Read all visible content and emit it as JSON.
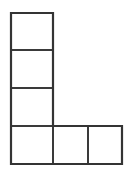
{
  "figure": {
    "name": "l-shape-polyomino",
    "title": "L-shaped grid of squares",
    "background_color": "#ffffff",
    "line_color": "#3a3a3a",
    "outline_color": "#343434",
    "cell_fill_color": "#ffffff",
    "line_width_px": 2,
    "canvas": {
      "width_px": 130,
      "height_px": 175
    },
    "grid": {
      "cell_width_px": 42,
      "cell_height_px": 38,
      "origin_x_px": 11,
      "origin_y_px": 13,
      "columns": 3,
      "rows": 4,
      "x_edges_px": [
        11,
        53,
        88,
        122
      ],
      "y_edges_px": [
        13,
        50,
        88,
        126,
        164
      ]
    },
    "cell_count": 6,
    "cells": [
      {
        "id": "cell-r0-c0",
        "row": 0,
        "col": 0,
        "x": 11,
        "y": 13,
        "width": 42,
        "height": 37,
        "label": ""
      },
      {
        "id": "cell-r1-c0",
        "row": 1,
        "col": 0,
        "x": 11,
        "y": 50,
        "width": 42,
        "height": 38,
        "label": ""
      },
      {
        "id": "cell-r2-c0",
        "row": 2,
        "col": 0,
        "x": 11,
        "y": 88,
        "width": 42,
        "height": 38,
        "label": ""
      },
      {
        "id": "cell-r3-c0",
        "row": 3,
        "col": 0,
        "x": 11,
        "y": 126,
        "width": 42,
        "height": 38,
        "label": ""
      },
      {
        "id": "cell-r3-c1",
        "row": 3,
        "col": 1,
        "x": 53,
        "y": 126,
        "width": 35,
        "height": 38,
        "label": ""
      },
      {
        "id": "cell-r3-c2",
        "row": 3,
        "col": 2,
        "x": 88,
        "y": 126,
        "width": 34,
        "height": 38,
        "label": ""
      }
    ],
    "outline_path": "M 11 13 L 53 13 L 53 126 L 122 126 L 122 164 L 11 164 Z",
    "interior_lines": [
      {
        "id": "divider-h1",
        "orientation": "horizontal",
        "x1": 11,
        "y1": 50,
        "x2": 53,
        "y2": 50
      },
      {
        "id": "divider-h2",
        "orientation": "horizontal",
        "x1": 11,
        "y1": 88,
        "x2": 53,
        "y2": 88
      },
      {
        "id": "divider-h3",
        "orientation": "horizontal",
        "x1": 11,
        "y1": 126,
        "x2": 53,
        "y2": 126
      },
      {
        "id": "divider-v1",
        "orientation": "vertical",
        "x1": 53,
        "y1": 126,
        "x2": 53,
        "y2": 164
      },
      {
        "id": "divider-v2",
        "orientation": "vertical",
        "x1": 88,
        "y1": 126,
        "x2": 88,
        "y2": 164
      }
    ]
  }
}
